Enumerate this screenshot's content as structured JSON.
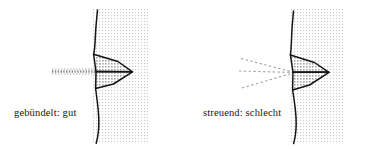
{
  "figure": {
    "background_color": "#ffffff",
    "ink_color": "#151515",
    "ray_color": "#9a9a9a",
    "panel_fill_color": "#f0f0f0",
    "ear_fill_color": "#d9d9d9"
  },
  "panels": [
    {
      "id": "focused",
      "caption": "gebündelt: gut",
      "ray_kind": "parallel-dashed",
      "ray_count": 1,
      "icon_name": "sound-ray-parallel-icon",
      "head_name": "head-profile-focused",
      "ear_name": "ear-horn-focused",
      "backdrop_name": "panel-backdrop-focused"
    },
    {
      "id": "scattered",
      "caption": "streuend: schlecht",
      "ray_kind": "diverging-dashed",
      "ray_count": 3,
      "icon_name": "sound-ray-diverging-icon",
      "head_name": "head-profile-scattered",
      "ear_name": "ear-horn-scattered",
      "backdrop_name": "panel-backdrop-scattered"
    }
  ]
}
